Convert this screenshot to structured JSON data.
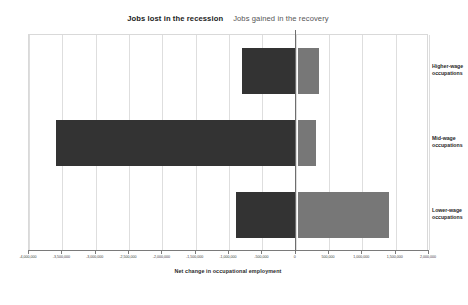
{
  "titles": {
    "lost": "Jobs lost in the recession",
    "gained": "Jobs gained in the recovery"
  },
  "colors": {
    "recession_bar": "#333333",
    "recovery_bar": "#777777",
    "gridline": "#dedede",
    "axis": "#7a7a7a"
  },
  "chart_data": {
    "type": "bar",
    "subtitle": "",
    "orientation": "horizontal",
    "xlabel": "Net change in occupational employment",
    "ylabel": "",
    "xlim": [
      -4000000,
      2000000
    ],
    "xtick_step": 500000,
    "grid": true,
    "legend": "none",
    "categories": [
      "Higher-wage occupations",
      "Mid-wage occupations",
      "Lower-wage occupations"
    ],
    "series": [
      {
        "name": "Jobs lost in the recession",
        "values": [
          -800000,
          -3600000,
          -900000
        ]
      },
      {
        "name": "Jobs gained in the recovery",
        "values": [
          350000,
          300000,
          1400000
        ]
      }
    ],
    "xticks": [
      {
        "value": -4000000,
        "label": "-4,000,000"
      },
      {
        "value": -3500000,
        "label": "-3,500,000"
      },
      {
        "value": -3000000,
        "label": "-3,000,000"
      },
      {
        "value": -2500000,
        "label": "-2,500,000"
      },
      {
        "value": -2000000,
        "label": "-2,000,000"
      },
      {
        "value": -1500000,
        "label": "-1,500,000"
      },
      {
        "value": -1000000,
        "label": "-1,000,000"
      },
      {
        "value": -500000,
        "label": "-500,000"
      },
      {
        "value": 0,
        "label": "0"
      },
      {
        "value": 500000,
        "label": "500,000"
      },
      {
        "value": 1000000,
        "label": "1,000,000"
      },
      {
        "value": 1500000,
        "label": "1,500,000"
      },
      {
        "value": 2000000,
        "label": "2,000,000"
      }
    ],
    "category_labels": [
      {
        "line1": "Higher-wage",
        "line2": "occupations"
      },
      {
        "line1": "Mid-wage",
        "line2": "occupations"
      },
      {
        "line1": "Lower-wage",
        "line2": "occupations"
      }
    ]
  }
}
